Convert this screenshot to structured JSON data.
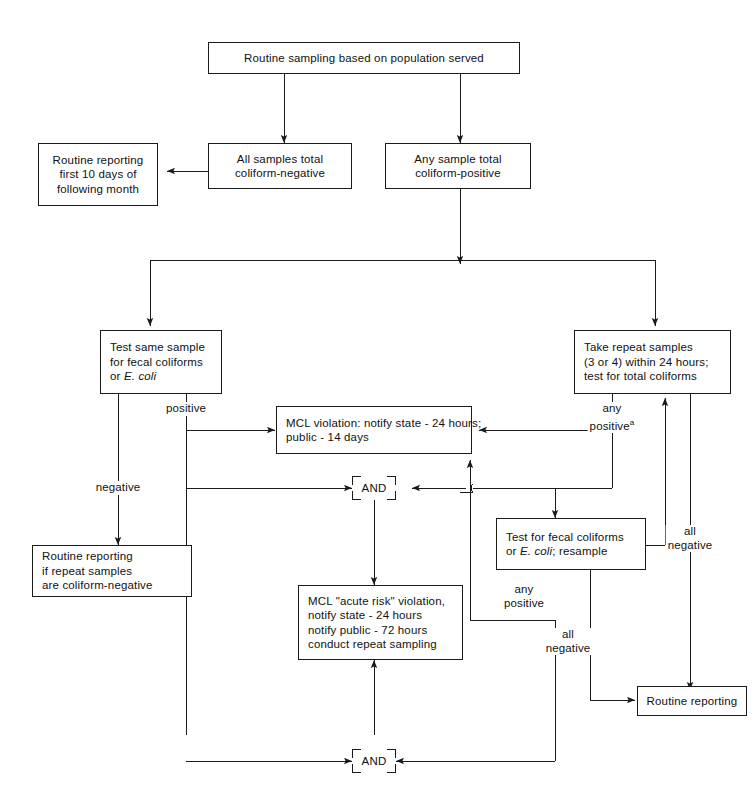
{
  "diagram": {
    "line_color": "#1a1a1a",
    "text_color": "#111111",
    "background": "#ffffff",
    "and_gate_label": "AND"
  },
  "nodes": {
    "routine_sampling": {
      "lines": [
        "Routine sampling based on population served"
      ]
    },
    "all_negative": {
      "lines": [
        "All samples total",
        "coliform-negative"
      ]
    },
    "any_positive": {
      "lines": [
        "Any sample total",
        "coliform-positive"
      ]
    },
    "routine_reporting_month": {
      "lines": [
        "Routine reporting",
        "first 10 days of",
        "following month"
      ]
    },
    "test_same_sample": {
      "lines": [
        "Test same sample",
        "for fecal coliforms",
        "or "
      ],
      "italic_tail": "E. coli"
    },
    "take_repeat_samples": {
      "lines": [
        "Take repeat samples",
        "(3 or 4) within 24 hours;",
        "test for total coliforms"
      ]
    },
    "mcl_violation": {
      "lines": [
        "MCL violation: notify state - 24 hours;",
        "public - 14 days"
      ]
    },
    "routine_reporting_repeat": {
      "lines": [
        "Routine reporting",
        "if repeat samples",
        "are coliform-negative"
      ]
    },
    "test_fecal_resample": {
      "prefix": "Test for fecal coliforms",
      "line2_a": "or ",
      "line2_i": "E. coli",
      "line2_b": "; resample"
    },
    "mcl_acute": {
      "lines": [
        "MCL \"acute risk\" violation,",
        "notify state - 24 hours",
        "notify public - 72 hours",
        "conduct repeat sampling"
      ]
    },
    "routine_reporting_final": {
      "lines": [
        "Routine reporting"
      ]
    }
  },
  "edge_labels": {
    "positive": "positive",
    "negative": "negative",
    "any_positive_a_l1": "any",
    "any_positive_a_l2": "positive",
    "any_positive_a_sup": "a",
    "all_negative_right_l1": "all",
    "all_negative_right_l2": "negative",
    "any_positive_mid_l1": "any",
    "any_positive_mid_l2": "positive",
    "all_negative_mid_l1": "all",
    "all_negative_mid_l2": "negative"
  },
  "gates": {
    "and_upper": "AND",
    "and_lower": "AND"
  }
}
